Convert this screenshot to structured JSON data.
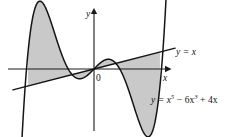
{
  "figure": {
    "background_color": "#ffffff",
    "fill_color": "#c9c9c9",
    "stroke_color": "#141414",
    "axis_color": "#1a1a1a"
  },
  "labels": {
    "y_axis": "y",
    "x_axis": "x",
    "origin": "0",
    "line_equation": "y = x",
    "curve_equation": "y = x⁵ − 6x³ + 4x",
    "curve_eq_lhs": "y = x",
    "curve_eq_exp1": "5",
    "curve_eq_mid": " − 6x",
    "curve_eq_exp2": "3",
    "curve_eq_tail": " + 4x",
    "line_eq_lhs": "y = x"
  },
  "chart_data": {
    "type": "line",
    "title": "",
    "xlabel": "x",
    "ylabel": "y",
    "grid": false,
    "legend": "inline-annotations",
    "xlim": [
      -2.6,
      2.6
    ],
    "ylim": [
      -8.5,
      8.5
    ],
    "x_axis_pixel_y": 69,
    "y_axis_pixel_x": 94,
    "pixels_per_unit_x": 29.5,
    "pixels_per_unit_y": 7.6,
    "series": [
      {
        "name": "y = x⁵ − 6x³ + 4x",
        "kind": "quintic",
        "coefficients": [
          0,
          4,
          0,
          -6,
          0,
          1
        ],
        "domain": [
          -2.45,
          2.45
        ],
        "samples": 260
      },
      {
        "name": "y = x",
        "kind": "linear",
        "coefficients": [
          0,
          1
        ],
        "domain": [
          -2.75,
          2.75
        ],
        "samples": 2
      }
    ],
    "intersections": [
      -2.236068,
      -1.0,
      0.0,
      1.0,
      2.236068
    ],
    "shaded_regions": [
      {
        "name": "left-region",
        "x_from": -2.236068,
        "x_to": 0.0,
        "upper": "quintic",
        "lower": "linear"
      },
      {
        "name": "right-region",
        "x_from": 0.0,
        "x_to": 2.236068,
        "upper": "linear",
        "lower": "quintic"
      }
    ],
    "annotations": [
      {
        "text": "y = x",
        "target": "linear",
        "x_px": 176,
        "y_px": 48
      },
      {
        "text": "y = x⁵ − 6x³ + 4x",
        "target": "quintic",
        "x_px": 151,
        "y_px": 96
      },
      {
        "text": "0",
        "target": "origin",
        "x_px": 97,
        "y_px": 80
      }
    ]
  }
}
